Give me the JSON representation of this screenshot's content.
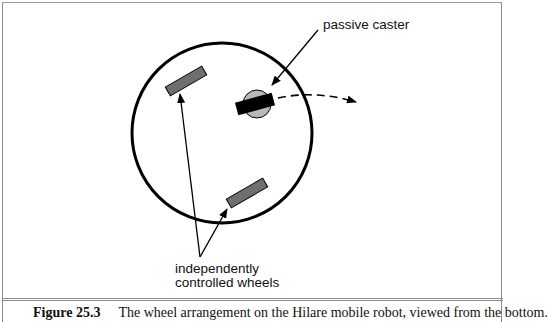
{
  "figure": {
    "labels": {
      "caster": "passive caster",
      "wheels_line1": "independently",
      "wheels_line2": "controlled wheels"
    },
    "caption": {
      "number": "Figure 25.3",
      "text": "The wheel arrangement on the Hilare mobile robot, viewed from the bottom."
    },
    "colors": {
      "wheel_fill": "#6f6f6f",
      "caster_disc": "#b8b8b8",
      "caster_bar": "#000000",
      "outline": "#000000",
      "frame": "#8a8a8a"
    }
  }
}
